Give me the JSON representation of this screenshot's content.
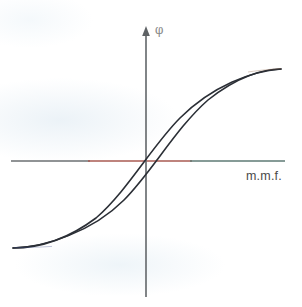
{
  "figure": {
    "background_color": "#ffffff"
  },
  "axes": {
    "vertical": {
      "name": "flux-axis",
      "label": "φ",
      "label_meaning": "magnetic flux (phi)",
      "color": "#6b6f72",
      "arrow": "up-arrowhead",
      "x_px": 146,
      "y_top_px": 28,
      "y_bottom_px": 297
    },
    "horizontal": {
      "name": "mmf-axis",
      "label": "m.m.f.",
      "label_meaning": "magnetomotive force",
      "color": "#6b6f72",
      "tint_color": "#a85a52",
      "y_px": 161,
      "x_left_px": 11,
      "x_right_px": 285
    }
  },
  "curve": {
    "name": "hysteresis-loop",
    "color": "#2b2f36",
    "stroke_width": 1.6,
    "description": "Closed S-shaped hysteresis loop of flux versus magnetomotive force",
    "branches": [
      {
        "name": "ascending-branch",
        "label": "increasing m.m.f.",
        "path": "M 13 248 C 45 247, 92 232, 124 200 C 152 172, 176 128, 208 100 C 238 76, 264 69, 281 69"
      },
      {
        "name": "descending-branch",
        "label": "decreasing m.m.f.",
        "path": "M 281 69 C 252 71, 212 86, 180 118 C 152 146, 128 190, 96 218 C 64 242, 34 248, 13 248"
      }
    ]
  },
  "chart_data": {
    "type": "line",
    "title": "",
    "xlabel": "m.m.f.",
    "ylabel": "φ",
    "grid": false,
    "legend": "none",
    "xlim": [
      -1.0,
      1.0
    ],
    "ylim": [
      -1.0,
      1.0
    ],
    "origin_px": [
      146,
      161
    ],
    "annotations": [
      {
        "name": "saturation-positive",
        "label": "",
        "px": [
          281,
          69
        ]
      },
      {
        "name": "saturation-negative",
        "label": "",
        "px": [
          13,
          248
        ]
      },
      {
        "name": "remanence-positive",
        "label": "",
        "px": [
          146,
          135
        ]
      },
      {
        "name": "remanence-negative",
        "label": "",
        "px": [
          146,
          185
        ]
      },
      {
        "name": "coercivity-negative",
        "label": "",
        "px": [
          123,
          161
        ]
      },
      {
        "name": "coercivity-positive",
        "label": "",
        "px": [
          178,
          161
        ]
      }
    ],
    "series": [
      {
        "name": "ascending-branch",
        "x": [
          -1.0,
          -0.8,
          -0.6,
          -0.4,
          -0.2,
          -0.17,
          0.0,
          0.2,
          0.4,
          0.6,
          0.8,
          1.0
        ],
        "y": [
          -0.97,
          -0.93,
          -0.84,
          -0.68,
          -0.33,
          0.0,
          0.29,
          0.57,
          0.76,
          0.88,
          0.94,
          0.97
        ]
      },
      {
        "name": "descending-branch",
        "x": [
          1.0,
          0.8,
          0.6,
          0.4,
          0.24,
          0.2,
          0.0,
          -0.2,
          -0.4,
          -0.6,
          -0.8,
          -1.0
        ],
        "y": [
          0.97,
          0.94,
          0.88,
          0.76,
          0.0,
          -0.07,
          -0.29,
          -0.57,
          -0.76,
          -0.88,
          -0.94,
          -0.97
        ]
      }
    ]
  }
}
